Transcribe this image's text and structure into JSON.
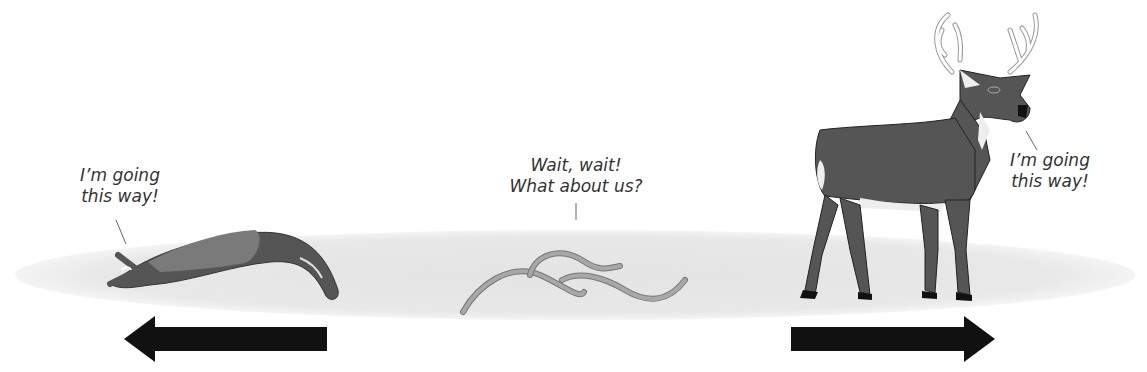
{
  "labels": {
    "slug_speech": "I’m going\nthis way!",
    "worms_speech": "Wait, wait!\nWhat about us?",
    "deer_speech": "I’m going\nthis way!"
  },
  "colors": {
    "ground": "#e6e6e6",
    "animal_dark": "#555555",
    "animal_mid": "#777777",
    "worm": "#a8a8a8",
    "arrow": "#111111"
  },
  "arrows": [
    {
      "direction": "left"
    },
    {
      "direction": "right"
    }
  ]
}
